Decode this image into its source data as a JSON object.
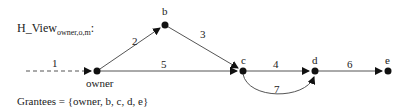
{
  "title": {
    "main": "H_View",
    "subscript": "owner,o,m",
    "suffix": ":"
  },
  "grantees_text": "Grantees = {owner, b, c, d, e}",
  "nodes": [
    {
      "id": "owner",
      "label": "owner",
      "x": 97,
      "y": 71
    },
    {
      "id": "b",
      "label": "b",
      "x": 165,
      "y": 25
    },
    {
      "id": "c",
      "label": "c",
      "x": 243,
      "y": 71
    },
    {
      "id": "d",
      "label": "d",
      "x": 315,
      "y": 71
    },
    {
      "id": "e",
      "label": "e",
      "x": 388,
      "y": 71
    }
  ],
  "edges": [
    {
      "label": "1",
      "from": "external",
      "to": "owner",
      "style": "dashed"
    },
    {
      "label": "2",
      "from": "owner",
      "to": "b",
      "style": "solid"
    },
    {
      "label": "3",
      "from": "b",
      "to": "c",
      "style": "solid"
    },
    {
      "label": "5",
      "from": "owner",
      "to": "c",
      "style": "solid"
    },
    {
      "label": "4",
      "from": "c",
      "to": "d",
      "style": "solid"
    },
    {
      "label": "6",
      "from": "d",
      "to": "e",
      "style": "solid"
    },
    {
      "label": "7",
      "from": "c",
      "to": "d",
      "style": "curved"
    }
  ]
}
